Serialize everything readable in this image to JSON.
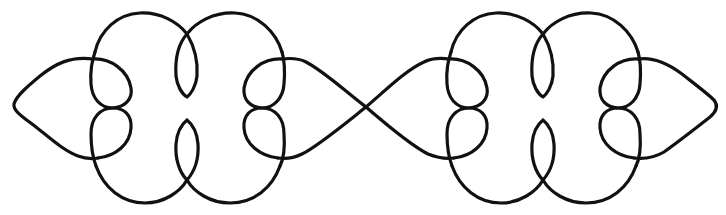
{
  "figure": {
    "units": [
      {
        "name": "knot-unit-left"
      },
      {
        "name": "knot-unit-right"
      }
    ],
    "colors": {
      "line": "#111111",
      "background": "#ffffff"
    }
  }
}
